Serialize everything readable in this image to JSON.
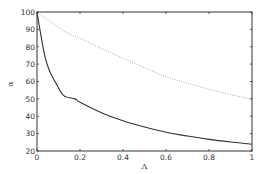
{
  "chart_data": {
    "type": "line",
    "title": "",
    "xlabel": "Λ",
    "ylabel": "α",
    "xlim": [
      0,
      1
    ],
    "ylim": [
      20,
      100
    ],
    "grid": false,
    "legend": null,
    "x_ticks": [
      "0",
      "0.2",
      "0.4",
      "0.6",
      "0.8",
      "1"
    ],
    "y_ticks": [
      "20",
      "30",
      "40",
      "50",
      "60",
      "70",
      "80",
      "90",
      "100"
    ],
    "series": [
      {
        "name": "solid",
        "style": "solid",
        "color": "#333333",
        "x": [
          0,
          0.014,
          0.037,
          0.06,
          0.093,
          0.126,
          0.177,
          0.2,
          0.3,
          0.4,
          0.5,
          0.6,
          0.7,
          0.8,
          0.9,
          1.0
        ],
        "y": [
          100,
          89.6,
          74.3,
          65.6,
          58,
          51.7,
          50,
          48,
          42,
          37.4,
          33.8,
          30.8,
          28.6,
          26.7,
          25.2,
          23.9
        ]
      },
      {
        "name": "dotted",
        "style": "dotted",
        "color": "#888888",
        "x": [
          0,
          0.126,
          0.2,
          0.3,
          0.4,
          0.5,
          0.6,
          0.7,
          0.8,
          0.9,
          1.0
        ],
        "y": [
          100,
          89,
          84.9,
          79,
          73.4,
          68,
          62.8,
          59,
          55.5,
          52.5,
          49.8
        ]
      }
    ]
  }
}
